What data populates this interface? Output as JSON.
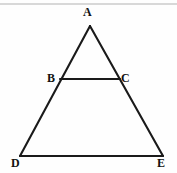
{
  "figure": {
    "kind": "geometry-diagram",
    "background_color": "#fefefe",
    "stroke_color": "#1a1a1a",
    "top_rule_color": "#d8d8d8",
    "labels": {
      "apex": "A",
      "left_mid": "B",
      "right_mid": "C",
      "bottom_left": "D",
      "bottom_right": "E"
    },
    "points": {
      "A": {
        "x": 90,
        "y": 26
      },
      "B": {
        "x": 60,
        "y": 79
      },
      "C": {
        "x": 120,
        "y": 79
      },
      "D": {
        "x": 20,
        "y": 156
      },
      "E": {
        "x": 163,
        "y": 156
      }
    },
    "segments": [
      {
        "name": "AD",
        "from": "A",
        "to": "D"
      },
      {
        "name": "AE",
        "from": "A",
        "to": "E"
      },
      {
        "name": "DE",
        "from": "D",
        "to": "E"
      },
      {
        "name": "BC",
        "from": "B",
        "to": "C"
      }
    ]
  }
}
